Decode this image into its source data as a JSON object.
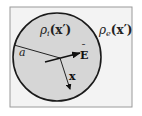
{
  "figure": {
    "background": "#ffffff",
    "frame": {
      "x": 10,
      "y": 7,
      "width": 122,
      "height": 100,
      "fill": "#f3f3f3",
      "stroke": "#9a9a9a"
    },
    "sphere": {
      "cx": 57,
      "cy": 57,
      "r": 44,
      "fill": "#d6d6d6",
      "stroke": "#1a1a1a"
    },
    "labels": {
      "interior_density": {
        "rho": "ρ",
        "sub": "i",
        "arg": "(x′)"
      },
      "exterior_density": {
        "rho": "ρ",
        "sub": "e",
        "arg": "(x′)"
      },
      "radius": "a",
      "field": "E",
      "field_bar": "¯",
      "position": "x"
    },
    "vectors": {
      "radius_line": {
        "x1": 14,
        "y1": 45,
        "x2": 60,
        "y2": 58
      },
      "field_arrow": {
        "x1": 45,
        "y1": 62,
        "x2": 80,
        "y2": 53
      },
      "position_arrow": {
        "x1": 60,
        "y1": 58,
        "x2": 70,
        "y2": 89
      }
    }
  }
}
